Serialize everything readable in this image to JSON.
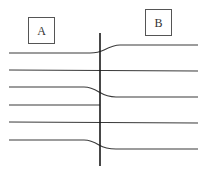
{
  "diagram": {
    "labels": {
      "a": "A",
      "b": "B"
    },
    "colors": {
      "background": "#ffffff",
      "line": "#3a3a3a",
      "boundary": "#1a1a1a",
      "box_stroke": "#555555"
    },
    "boundary_x": 100,
    "boundary_y_range": [
      33,
      166
    ],
    "left_lines_y": [
      53,
      70,
      87,
      105,
      122,
      140
    ],
    "right_lines_y": [
      45,
      71,
      97,
      123,
      149
    ],
    "connections": [
      {
        "from_left_y": 53,
        "to_right_y": 45
      },
      {
        "from_left_y": 87,
        "to_right_y": 97
      },
      {
        "from_left_y": 140,
        "to_right_y": 149
      }
    ]
  }
}
